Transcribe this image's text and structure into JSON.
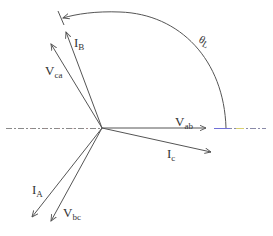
{
  "diagram": {
    "type": "phasor-diagram",
    "reference_axis": {
      "style": "dash-dot",
      "colors": [
        "#8a8a8a",
        "#6a6ad0",
        "#d0c060",
        "#c08080"
      ]
    },
    "angle_label": {
      "main": "θ",
      "sub": "L"
    },
    "phasors": [
      {
        "id": "Vab",
        "main": "V",
        "sub": "ab"
      },
      {
        "id": "Ic",
        "main": "I",
        "sub": "c"
      },
      {
        "id": "IB",
        "main": "I",
        "sub": "B"
      },
      {
        "id": "Vca",
        "main": "V",
        "sub": "ca"
      },
      {
        "id": "IA",
        "main": "I",
        "sub": "A"
      },
      {
        "id": "Vbc",
        "main": "V",
        "sub": "bc"
      }
    ],
    "line_color": "#555555"
  }
}
